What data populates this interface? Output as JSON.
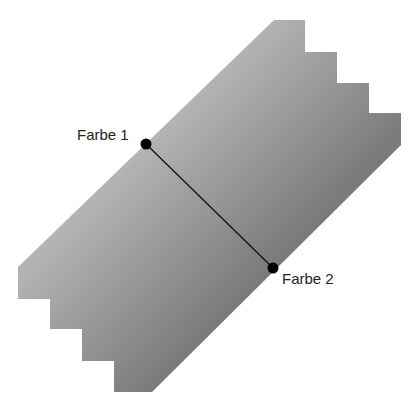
{
  "diagram": {
    "type": "linear-gradient-illustration",
    "shape": {
      "name": "stepped-diagonal-band",
      "fill_gradient": {
        "start_color": "#b4b4b4",
        "end_color": "#7a7a7a"
      }
    },
    "gradient_line": {
      "start": {
        "label": "Farbe 1",
        "x": 146,
        "y": 144
      },
      "end": {
        "label": "Farbe 2",
        "x": 273,
        "y": 268
      },
      "color": "#111111"
    }
  }
}
